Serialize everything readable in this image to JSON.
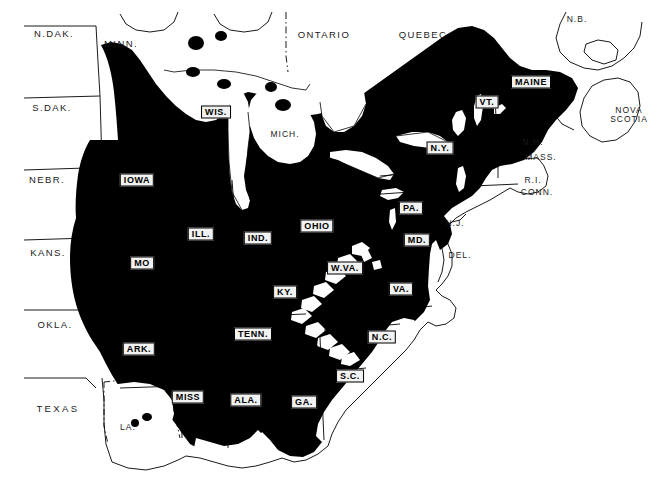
{
  "figure": {
    "kind": "thematic-distribution-map",
    "region": "Eastern United States and adjacent Canada",
    "style": "black shaded range over white base map",
    "frame_color": "#111111",
    "shade_color": "#000000",
    "base_color": "#ffffff"
  },
  "legend_colors": {
    "shaded_range": "#000000",
    "unshaded_area": "#ffffff",
    "boundary_line": "#000000",
    "label_plaque": "#f2f2f2"
  },
  "labels": {
    "shaded_states": [
      {
        "id": "iowa",
        "text": "IOWA",
        "x": 137,
        "y": 180
      },
      {
        "id": "wis",
        "text": "WIS.",
        "x": 216,
        "y": 112
      },
      {
        "id": "ill",
        "text": "ILL.",
        "x": 201,
        "y": 234
      },
      {
        "id": "ind",
        "text": "IND.",
        "x": 258,
        "y": 238
      },
      {
        "id": "ohio",
        "text": "OHIO",
        "x": 317,
        "y": 226
      },
      {
        "id": "mo",
        "text": "MO",
        "x": 142,
        "y": 263
      },
      {
        "id": "ky",
        "text": "KY.",
        "x": 285,
        "y": 292
      },
      {
        "id": "ark",
        "text": "ARK.",
        "x": 139,
        "y": 349
      },
      {
        "id": "tenn",
        "text": "TENN.",
        "x": 253,
        "y": 334
      },
      {
        "id": "miss",
        "text": "MISS",
        "x": 188,
        "y": 397
      },
      {
        "id": "ala",
        "text": "ALA.",
        "x": 246,
        "y": 400
      },
      {
        "id": "ga",
        "text": "GA.",
        "x": 304,
        "y": 402
      },
      {
        "id": "sc",
        "text": "S.C.",
        "x": 350,
        "y": 376
      },
      {
        "id": "nc",
        "text": "N.C.",
        "x": 382,
        "y": 337
      },
      {
        "id": "va",
        "text": "VA.",
        "x": 401,
        "y": 289
      },
      {
        "id": "wva",
        "text": "W.VA.",
        "x": 345,
        "y": 268
      },
      {
        "id": "md",
        "text": "MD.",
        "x": 417,
        "y": 240
      },
      {
        "id": "pa",
        "text": "PA.",
        "x": 411,
        "y": 208
      },
      {
        "id": "ny",
        "text": "N.Y.",
        "x": 440,
        "y": 148
      },
      {
        "id": "vt",
        "text": "VT.",
        "x": 487,
        "y": 102
      },
      {
        "id": "maine",
        "text": "MAINE",
        "x": 531,
        "y": 82
      }
    ],
    "unshaded_states": [
      {
        "id": "ndak",
        "text": "N.DAK.",
        "x": 54,
        "y": 34,
        "cls": "label-plain"
      },
      {
        "id": "sdak",
        "text": "S.DAK.",
        "x": 52,
        "y": 108,
        "cls": "label-plain"
      },
      {
        "id": "nebr",
        "text": "NEBR.",
        "x": 47,
        "y": 180,
        "cls": "label-plain"
      },
      {
        "id": "kans",
        "text": "KANS.",
        "x": 48,
        "y": 253,
        "cls": "label-plain"
      },
      {
        "id": "okla",
        "text": "OKLA.",
        "x": 55,
        "y": 325,
        "cls": "label-plain"
      },
      {
        "id": "texas",
        "text": "TEXAS",
        "x": 58,
        "y": 409,
        "cls": "label-plain wide"
      },
      {
        "id": "minn",
        "text": "MINN.",
        "x": 121,
        "y": 44,
        "cls": "label-plain"
      },
      {
        "id": "mich",
        "text": "MICH.",
        "x": 285,
        "y": 134,
        "cls": "label-plain label-small"
      },
      {
        "id": "la",
        "text": "LA.",
        "x": 128,
        "y": 427,
        "cls": "label-plain label-small"
      },
      {
        "id": "nj",
        "text": "N.J.",
        "x": 455,
        "y": 223,
        "cls": "label-plain label-small"
      },
      {
        "id": "del",
        "text": "DEL.",
        "x": 460,
        "y": 255,
        "cls": "label-plain label-small"
      },
      {
        "id": "nh",
        "text": "N.H.",
        "x": 533,
        "y": 142,
        "cls": "label-plain label-small"
      },
      {
        "id": "mass",
        "text": "MASS.",
        "x": 541,
        "y": 157,
        "cls": "label-plain label-small"
      },
      {
        "id": "ri",
        "text": "R.I.",
        "x": 533,
        "y": 180,
        "cls": "label-plain label-small"
      },
      {
        "id": "conn",
        "text": "CONN.",
        "x": 537,
        "y": 192,
        "cls": "label-plain label-small"
      }
    ],
    "canada": [
      {
        "id": "ontario",
        "text": "ONTARIO",
        "x": 324,
        "y": 35,
        "cls": "label-plain"
      },
      {
        "id": "quebec",
        "text": "QUEBEC",
        "x": 423,
        "y": 35,
        "cls": "label-plain"
      },
      {
        "id": "nb",
        "text": "N.B.",
        "x": 577,
        "y": 19,
        "cls": "label-plain label-small"
      }
    ],
    "canada_two_line": [
      {
        "id": "nova-scotia",
        "line1": "NOVA",
        "line2": "SCOTIA",
        "x": 629,
        "y": 115
      }
    ]
  }
}
